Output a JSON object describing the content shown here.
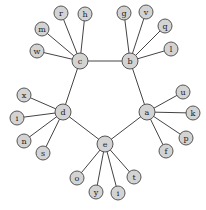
{
  "graph": {
    "type": "undirected",
    "hubs": [
      "a",
      "b",
      "c",
      "d",
      "e"
    ],
    "nodes": [
      {
        "id": "c",
        "label": "c",
        "x": 80,
        "y": 61,
        "r": 8
      },
      {
        "id": "b",
        "label": "b",
        "x": 130,
        "y": 61,
        "r": 8
      },
      {
        "id": "a",
        "label": "a",
        "x": 147,
        "y": 112,
        "r": 8
      },
      {
        "id": "e",
        "label": "e",
        "x": 105,
        "y": 144,
        "r": 8
      },
      {
        "id": "d",
        "label": "d",
        "x": 63,
        "y": 112,
        "r": 8
      },
      {
        "id": "r",
        "label": "r",
        "x": 61,
        "y": 13,
        "r": 7
      },
      {
        "id": "h",
        "label": "h",
        "x": 85,
        "y": 14,
        "r": 7
      },
      {
        "id": "m",
        "label": "m",
        "x": 42,
        "y": 29,
        "r": 7
      },
      {
        "id": "w",
        "label": "w",
        "x": 37,
        "y": 51,
        "r": 7
      },
      {
        "id": "g",
        "label": "g",
        "x": 124,
        "y": 13,
        "r": 7
      },
      {
        "id": "v",
        "label": "v",
        "x": 146,
        "y": 12,
        "r": 7
      },
      {
        "id": "q",
        "label": "q",
        "x": 165,
        "y": 26,
        "r": 7
      },
      {
        "id": "l",
        "label": "l",
        "x": 171,
        "y": 49,
        "r": 7
      },
      {
        "id": "u",
        "label": "u",
        "x": 183,
        "y": 92,
        "r": 7
      },
      {
        "id": "k",
        "label": "k",
        "x": 193,
        "y": 113,
        "r": 7
      },
      {
        "id": "p",
        "label": "p",
        "x": 186,
        "y": 138,
        "r": 7
      },
      {
        "id": "f",
        "label": "f",
        "x": 166,
        "y": 151,
        "r": 7
      },
      {
        "id": "t",
        "label": "t",
        "x": 134,
        "y": 177,
        "r": 7
      },
      {
        "id": "i2",
        "label": "i",
        "x": 118,
        "y": 193,
        "r": 7
      },
      {
        "id": "y",
        "label": "y",
        "x": 96,
        "y": 192,
        "r": 7
      },
      {
        "id": "o",
        "label": "o",
        "x": 77,
        "y": 178,
        "r": 7
      },
      {
        "id": "x",
        "label": "x",
        "x": 24,
        "y": 95,
        "r": 7
      },
      {
        "id": "i1",
        "label": "i",
        "x": 17,
        "y": 118,
        "r": 7
      },
      {
        "id": "n",
        "label": "n",
        "x": 24,
        "y": 141,
        "r": 7
      },
      {
        "id": "s",
        "label": "s",
        "x": 43,
        "y": 153,
        "r": 7
      }
    ],
    "edges": [
      [
        "c",
        "b"
      ],
      [
        "b",
        "a"
      ],
      [
        "a",
        "e"
      ],
      [
        "e",
        "d"
      ],
      [
        "d",
        "c"
      ],
      [
        "c",
        "r"
      ],
      [
        "c",
        "h"
      ],
      [
        "c",
        "m"
      ],
      [
        "c",
        "w"
      ],
      [
        "b",
        "g"
      ],
      [
        "b",
        "v"
      ],
      [
        "b",
        "q"
      ],
      [
        "b",
        "l"
      ],
      [
        "a",
        "u"
      ],
      [
        "a",
        "k"
      ],
      [
        "a",
        "p"
      ],
      [
        "a",
        "f"
      ],
      [
        "e",
        "t"
      ],
      [
        "e",
        "i2"
      ],
      [
        "e",
        "y"
      ],
      [
        "e",
        "o"
      ],
      [
        "d",
        "x"
      ],
      [
        "d",
        "i1"
      ],
      [
        "d",
        "n"
      ],
      [
        "d",
        "s"
      ]
    ]
  }
}
